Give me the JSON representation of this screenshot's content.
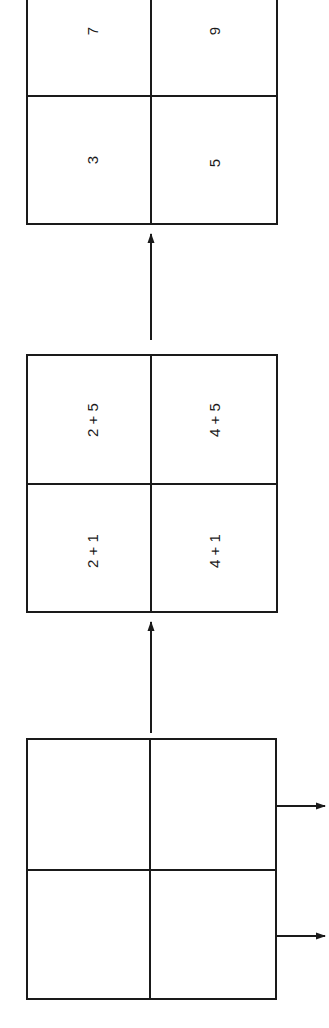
{
  "diagram": {
    "orientation": "rotated-90-ccw",
    "colors": {
      "line": "#1a1a1a",
      "background": "#ffffff"
    },
    "grids": [
      {
        "id": "input-grid",
        "cells": [
          {
            "label": ""
          },
          {
            "label": ""
          },
          {
            "label": ""
          },
          {
            "label": ""
          }
        ]
      },
      {
        "id": "sum-expression-grid",
        "cells": [
          {
            "label": "2 + 1"
          },
          {
            "label": "2 + 5"
          },
          {
            "label": "4 + 1"
          },
          {
            "label": "4 + 5"
          }
        ]
      },
      {
        "id": "result-grid",
        "cells": [
          {
            "label": "3"
          },
          {
            "label": "7"
          },
          {
            "label": "5"
          },
          {
            "label": "9"
          }
        ]
      }
    ],
    "arrows": [
      {
        "from": "input-grid",
        "to": "sum-expression-grid"
      },
      {
        "from": "sum-expression-grid",
        "to": "result-grid"
      },
      {
        "from": "input-grid",
        "to": "output-1"
      },
      {
        "from": "input-grid",
        "to": "output-2"
      }
    ]
  }
}
